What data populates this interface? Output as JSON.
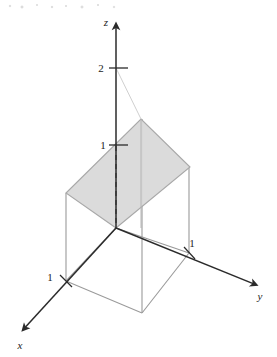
{
  "figure": {
    "background_color": "#ffffff",
    "width": 277,
    "height": 357
  },
  "colors": {
    "axis": "#2b2b2b",
    "box_edge": "#9a9a9a",
    "plane_fill": "#d9d9d9",
    "plane_edge": "#a8a8a8",
    "thin_guide": "#c9c9c9",
    "dashed": "#3a3a3a",
    "text": "#1c1c1c"
  },
  "axes": {
    "z": {
      "label": "z",
      "label_x": 106,
      "label_y": 26,
      "origin_x": 116,
      "origin_y": 228,
      "tip_x": 116,
      "tip_y": 21
    },
    "y": {
      "label": "y",
      "label_x": 260,
      "label_y": 300,
      "origin_x": 116,
      "origin_y": 228,
      "tip_x": 259,
      "tip_y": 286
    },
    "x": {
      "label": "x",
      "label_x": 20,
      "label_y": 349,
      "origin_x": 116,
      "origin_y": 228,
      "tip_x": 21,
      "tip_y": 332
    }
  },
  "ticks": [
    {
      "name": "z-tick-2",
      "label": "2",
      "axis": "z",
      "value": 2,
      "tick_x": 116,
      "tick_y": 68,
      "label_x": 101,
      "label_y": 72
    },
    {
      "name": "z-tick-1",
      "label": "1",
      "axis": "z",
      "value": 1,
      "tick_x": 116,
      "tick_y": 145,
      "label_x": 103,
      "label_y": 149
    },
    {
      "name": "y-tick-1",
      "label": "1",
      "axis": "y",
      "value": 1,
      "tick_x": 189,
      "tick_y": 253,
      "label_x": 192,
      "label_y": 247
    },
    {
      "name": "x-tick-1",
      "label": "1",
      "axis": "x",
      "value": 1,
      "tick_x": 66,
      "tick_y": 281,
      "label_x": 50,
      "label_y": 281
    }
  ],
  "geometry": {
    "origin": {
      "x": 116,
      "y": 228
    },
    "base_square": {
      "o": {
        "x": 116,
        "y": 228
      },
      "x1": {
        "x": 66,
        "y": 281
      },
      "xy": {
        "x": 142,
        "y": 313
      },
      "y1": {
        "x": 189,
        "y": 253
      }
    },
    "plane_quad": {
      "bottom": {
        "x": 116,
        "y": 228
      },
      "left": {
        "x": 66,
        "y": 193
      },
      "peak": {
        "x": 141,
        "y": 119
      },
      "right": {
        "x": 190,
        "y": 167
      }
    },
    "vertical_edges": [
      {
        "name": "edge-at-x1",
        "x1": 66,
        "y1": 281,
        "x2": 66,
        "y2": 193
      },
      {
        "name": "edge-at-xy",
        "x1": 142,
        "y1": 313,
        "x2": 142,
        "y2": 119
      },
      {
        "name": "edge-at-y1",
        "x1": 189,
        "y1": 253,
        "x2": 189,
        "y2": 167
      }
    ],
    "dashed_segment": {
      "x1": 116,
      "y1": 145,
      "x2": 116,
      "y2": 228
    },
    "guide_line": {
      "x1": 116,
      "y1": 68,
      "x2": 141,
      "y2": 119
    }
  }
}
